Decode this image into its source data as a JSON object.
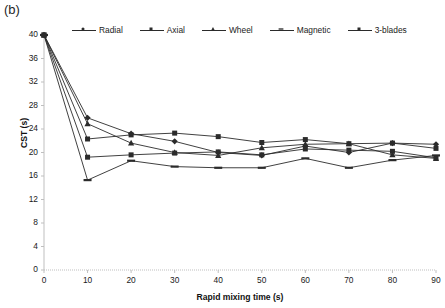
{
  "figure": {
    "panel_label": "(b)",
    "background": "#ffffff",
    "line_color": "#2b2b2b",
    "axis_color": "#bfbfbf",
    "text_color": "#1a1a1a"
  },
  "chart_data": {
    "type": "line",
    "title": "",
    "subtitle": "",
    "xlabel": "Rapid mixing time (s)",
    "ylabel": "CST (s)",
    "x": [
      0,
      10,
      20,
      30,
      40,
      50,
      60,
      70,
      80,
      90
    ],
    "xlim": [
      0,
      90
    ],
    "ylim": [
      0,
      40
    ],
    "xticks": [
      0,
      10,
      20,
      30,
      40,
      50,
      60,
      70,
      80,
      90
    ],
    "yticks": [
      0,
      4,
      8,
      12,
      16,
      20,
      24,
      28,
      32,
      36,
      40
    ],
    "grid": false,
    "legend_position": "top",
    "series": [
      {
        "name": "Radial",
        "marker": "diamond",
        "values": [
          40.0,
          25.9,
          23.2,
          21.9,
          20.0,
          19.5,
          21.1,
          20.0,
          21.6,
          21.4
        ]
      },
      {
        "name": "Axial",
        "marker": "square",
        "values": [
          40.0,
          22.3,
          23.0,
          23.3,
          22.7,
          21.7,
          22.2,
          21.5,
          21.6,
          20.7
        ]
      },
      {
        "name": "Wheel",
        "marker": "triangle",
        "values": [
          40.0,
          24.9,
          21.6,
          20.0,
          19.5,
          20.8,
          21.4,
          21.5,
          19.6,
          19.0
        ]
      },
      {
        "name": "Magnetic",
        "marker": "dash",
        "values": [
          40.0,
          15.3,
          18.6,
          17.6,
          17.4,
          17.4,
          19.0,
          17.4,
          18.7,
          19.5
        ]
      },
      {
        "name": "3-blades",
        "marker": "square",
        "values": [
          40.0,
          19.2,
          19.6,
          19.9,
          20.1,
          19.6,
          20.6,
          20.4,
          20.2,
          19.1
        ]
      }
    ]
  }
}
